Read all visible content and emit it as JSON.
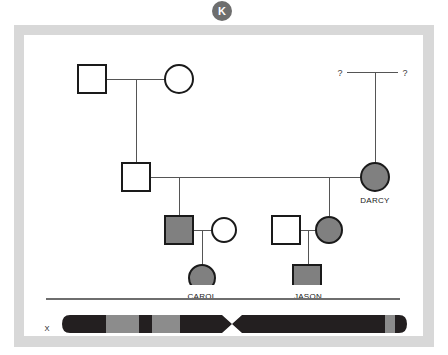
{
  "badge": {
    "letter": "K",
    "color": "#6e6e6e"
  },
  "card": {
    "frame_color": "#d8d8d8",
    "panel_color": "#ffffff"
  },
  "pedigree": {
    "affected_fill": "#808080",
    "unaffected_fill": "#ffffff",
    "stroke": "#1a1a1a",
    "line_color": "#555555",
    "generations": [
      {
        "id": "gen1",
        "members": [
          {
            "name": "",
            "sex": "male",
            "shape": "square",
            "affected": false,
            "x": 68,
            "y": 44,
            "label": ""
          },
          {
            "name": "",
            "sex": "female",
            "shape": "circle",
            "affected": false,
            "x": 155,
            "y": 44,
            "label": ""
          },
          {
            "name": "",
            "sex": "unknown",
            "shape": "question",
            "affected": false,
            "x": 316,
            "y": 37,
            "label": "?"
          },
          {
            "name": "",
            "sex": "unknown",
            "shape": "question",
            "affected": false,
            "x": 381,
            "y": 37,
            "label": "?"
          }
        ]
      },
      {
        "id": "gen2",
        "members": [
          {
            "name": "",
            "sex": "male",
            "shape": "square",
            "affected": false,
            "x": 112,
            "y": 142,
            "label": ""
          },
          {
            "name": "DARCY",
            "sex": "female",
            "shape": "circle",
            "affected": true,
            "x": 351,
            "y": 142,
            "label": "DARCY"
          }
        ]
      },
      {
        "id": "gen3",
        "members": [
          {
            "name": "",
            "sex": "male",
            "shape": "square",
            "affected": true,
            "x": 155,
            "y": 195,
            "label": ""
          },
          {
            "name": "",
            "sex": "female",
            "shape": "circle",
            "affected": false,
            "x": 200,
            "y": 195,
            "label": ""
          },
          {
            "name": "",
            "sex": "male",
            "shape": "square",
            "affected": false,
            "x": 262,
            "y": 195,
            "label": ""
          },
          {
            "name": "",
            "sex": "female",
            "shape": "circle",
            "affected": true,
            "x": 305,
            "y": 195,
            "label": ""
          }
        ]
      },
      {
        "id": "gen4",
        "members": [
          {
            "name": "CAROL",
            "sex": "female",
            "shape": "circle",
            "affected": true,
            "x": 178,
            "y": 243,
            "label": "CAROL"
          },
          {
            "name": "JASON",
            "sex": "male",
            "shape": "square",
            "affected": true,
            "x": 281,
            "y": 243,
            "label": "JASON"
          }
        ]
      }
    ],
    "labels": {
      "darcy": "DARCY",
      "carol": "CAROL",
      "jason": "JASON",
      "unknown_left": "?",
      "unknown_right": "?"
    }
  },
  "chromosome": {
    "label": "X",
    "dark_band_color": "#231f20",
    "light_band_color": "#8c8c8c",
    "bands": [
      {
        "color": "dark",
        "start": 0,
        "width": 42
      },
      {
        "color": "light",
        "start": 42,
        "width": 40
      },
      {
        "color": "dark",
        "start": 82,
        "width": 16
      },
      {
        "color": "light",
        "start": 98,
        "width": 33
      },
      {
        "color": "dark",
        "start": 131,
        "width": 40
      },
      {
        "color": "dark",
        "start": 171,
        "width": 188
      },
      {
        "color": "light",
        "start": 359,
        "width": 12
      },
      {
        "color": "dark",
        "start": 371,
        "width": 14
      }
    ],
    "centromere_position": 168
  }
}
